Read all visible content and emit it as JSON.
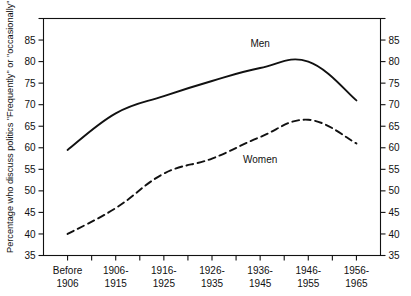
{
  "chart_data": {
    "type": "line",
    "title": "",
    "xlabel": "",
    "ylabel": "Percentage who discuss politics \"Frequently\" or \"occasionally\"",
    "categories": [
      "Before 1906",
      "1906-1915",
      "1916-1925",
      "1926-1935",
      "1936-1945",
      "1946-1955",
      "1956-1965"
    ],
    "category_lines": [
      [
        "Before",
        "1906"
      ],
      [
        "1906-",
        "1915"
      ],
      [
        "1916-",
        "1925"
      ],
      [
        "1926-",
        "1935"
      ],
      [
        "1936-",
        "1945"
      ],
      [
        "1946-",
        "1955"
      ],
      [
        "1956-",
        "1965"
      ]
    ],
    "series": [
      {
        "name": "Men",
        "style": "solid",
        "color": "#111111",
        "values": [
          59.5,
          68,
          72,
          75.5,
          78.5,
          80,
          71
        ]
      },
      {
        "name": "Women",
        "style": "dashed",
        "color": "#111111",
        "values": [
          40,
          46,
          54,
          57.5,
          62.5,
          66.5,
          61
        ]
      }
    ],
    "ylim": [
      35,
      90
    ],
    "ytick_labels": [
      "35",
      "40",
      "45",
      "50",
      "55",
      "60",
      "65",
      "70",
      "75",
      "80",
      "85"
    ],
    "ytick_values": [
      35,
      40,
      45,
      50,
      55,
      60,
      65,
      70,
      75,
      80,
      85
    ],
    "yticks_unlabeled": [
      90
    ],
    "grid": false,
    "legend_position": "inline-annotations",
    "annotations": [
      {
        "text": "Men",
        "x_category_index": 4,
        "y_value": 83.5
      },
      {
        "text": "Women",
        "x_category_index": 4,
        "y_value": 56.5
      }
    ],
    "axis_labels_both_sides": true
  }
}
